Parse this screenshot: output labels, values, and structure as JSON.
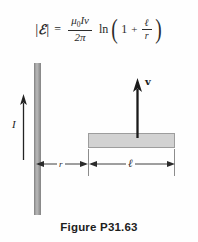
{
  "figure": {
    "caption": "Figure P31.63",
    "equation": {
      "lhs_magnitude_open": "|",
      "lhs_symbol": "ℰ",
      "lhs_magnitude_close": "|",
      "equals": "=",
      "fraction_numerator": "μ",
      "fraction_numerator_sub": "0",
      "fraction_numerator_rest": "Iv",
      "fraction_denominator": "2π",
      "log_function": "ln",
      "paren_open": "(",
      "one": "1",
      "plus": "+",
      "inner_numerator": "ℓ",
      "inner_denominator": "r",
      "paren_close": ")",
      "plain_text": "|ℰ| = (μ₀Iv)/(2π) ln(1 + ℓ/r)"
    },
    "labels": {
      "current": "I",
      "velocity": "v",
      "distance_r": "r",
      "length_l": "ℓ"
    },
    "colors": {
      "wire_fill": "#b9b9b9",
      "bar_fill": "#d2d2d2",
      "bar_stroke": "#9d9d9d",
      "ink": "#232323",
      "background": "#fefefe"
    },
    "elements": {
      "wire_name": "current-carrying-wire",
      "bar_name": "sliding-conducting-bar",
      "current_arrow_direction": "up",
      "velocity_arrow_direction": "up"
    }
  }
}
